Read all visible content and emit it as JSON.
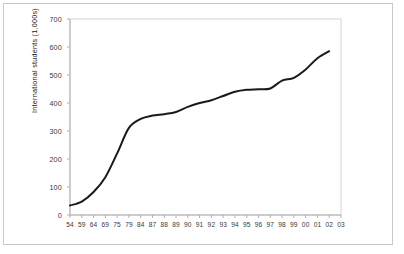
{
  "chart_data": {
    "type": "line",
    "title": "",
    "subtitle": "",
    "xlabel": "",
    "ylabel": "International students (1,000s)",
    "ylim": [
      0,
      700
    ],
    "yticks": [
      0,
      100,
      200,
      300,
      400,
      500,
      600,
      700
    ],
    "ytick_labels": [
      "0",
      "100",
      "200",
      "300",
      "400",
      "500",
      "600",
      "700"
    ],
    "grid": false,
    "legend": "none",
    "line_color": "#1a1a1a",
    "line_width": 2.0,
    "categories": [
      "54",
      "59",
      "64",
      "69",
      "75",
      "79",
      "84",
      "87",
      "88",
      "89",
      "90",
      "91",
      "92",
      "93",
      "94",
      "95",
      "96",
      "97",
      "98",
      "99",
      "00",
      "01",
      "02",
      "03"
    ],
    "xtick_labels": [
      "54",
      "59",
      "64",
      "69",
      "75",
      "79",
      "84",
      "87",
      "88",
      "89",
      "90",
      "91",
      "92",
      "93",
      "94",
      "95",
      "96",
      "97",
      "98",
      "99",
      "00",
      "01",
      "02",
      "03"
    ],
    "series": [
      {
        "name": "International students",
        "values": [
          34,
          48,
          82,
          135,
          220,
          311,
          343,
          355,
          360,
          368,
          386,
          400,
          410,
          425,
          440,
          447,
          449,
          452,
          480,
          490,
          520,
          560,
          585,
          null
        ]
      }
    ]
  },
  "figure": {
    "border_color": "#c9c9c9",
    "plot_border_color": "#d0d0d0",
    "background": "#ffffff"
  }
}
